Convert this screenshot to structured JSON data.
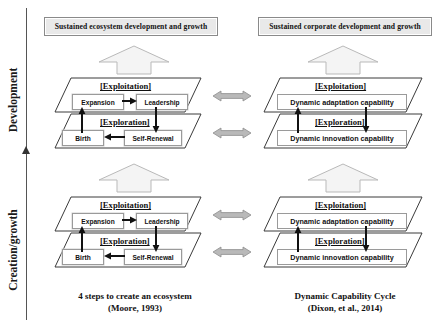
{
  "axis": {
    "top_label": "Development",
    "bottom_label": "Creation/growth",
    "arrow_icon": "up-arrow-icon"
  },
  "left_column": {
    "banner": "Sustained ecosystem development and growth",
    "block_arrow_icon": "block-up-arrow-icon",
    "development_stage": {
      "exploitation_label": "[Exploitation]",
      "exploration_label": "[Exploration]",
      "nodes": {
        "expansion": "Expansion",
        "leadership": "Leadership",
        "birth": "Birth",
        "self_renewal": "Self-Renewal"
      }
    },
    "creation_stage": {
      "exploitation_label": "[Exploitation]",
      "exploration_label": "[Exploration]",
      "nodes": {
        "expansion": "Expansion",
        "leadership": "Leadership",
        "birth": "Birth",
        "self_renewal": "Self-Renewal"
      }
    },
    "caption_line1": "4 steps to create an ecosystem",
    "caption_line2": "(Moore, 1993)"
  },
  "right_column": {
    "banner": "Sustained corporate development and growth",
    "block_arrow_icon": "block-up-arrow-icon",
    "development_stage": {
      "exploitation_label": "[Exploitation]",
      "exploration_label": "[Exploration]",
      "nodes": {
        "adaptation": "Dynamic adaptation capability",
        "innovation": "Dynamic innovation capability"
      }
    },
    "creation_stage": {
      "exploitation_label": "[Exploitation]",
      "exploration_label": "[Exploration]",
      "nodes": {
        "adaptation": "Dynamic adaptation capability",
        "innovation": "Dynamic innovation capability"
      }
    },
    "caption_line1": "Dynamic Capability Cycle",
    "caption_line2": "(Dixon, et al., 2014)"
  },
  "connectors": {
    "icon": "double-headed-arrow-icon",
    "count": 4
  },
  "colors": {
    "banner_fill": "#e9e9e9",
    "banner_border": "#8a8a8a",
    "plane_stroke": "#3a3a3a",
    "block_arrow_fill": "#f2f2f2",
    "block_arrow_stroke": "#b5b5b5",
    "link_arrow_fill": "#b9b9b9",
    "link_arrow_stroke": "#8d8d8d",
    "node_border": "#9a9a9a",
    "flow_arrow": "#111111"
  }
}
